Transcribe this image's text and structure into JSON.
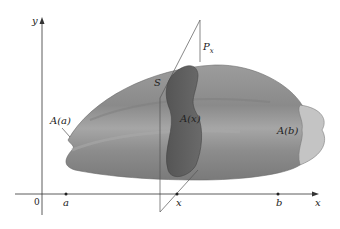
{
  "figure": {
    "type": "solid-cross-section-diagram",
    "axes": {
      "y_label": "y",
      "x_label": "x",
      "origin_label": "0"
    },
    "tick_labels": {
      "a": "a",
      "x": "x",
      "b": "b"
    },
    "labels": {
      "solid": "S",
      "plane": "P",
      "plane_subscript": "x",
      "area_a": "A(a)",
      "area_x": "A(x)",
      "area_b": "A(b)"
    },
    "colors": {
      "solid_body": "#8f8f8f",
      "solid_highlight": "#b4b4b4",
      "solid_shadow": "#6e6e6e",
      "cross_section": "#5e5e5e",
      "end_cap": "#c7c7c7",
      "axis": "#333333",
      "plane_line": "#555555"
    }
  }
}
